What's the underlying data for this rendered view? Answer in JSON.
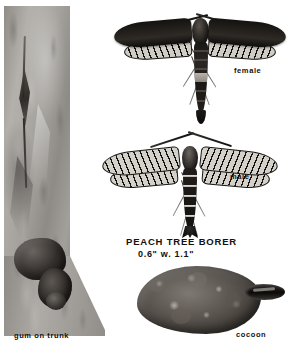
{
  "plate": {
    "subject": "PEACH TREE BORER",
    "background_color": "#ffffff",
    "ink_color": "#111111"
  },
  "title_block": {
    "common_name": "PEACH TREE BORER",
    "size_line": "0.6\" w. 1.1\"",
    "body_length": "0.6\"",
    "wingspan_prefix": "w.",
    "wingspan": "1.1\""
  },
  "figures": [
    {
      "id": "gum-on-trunk",
      "caption": "gum on trunk",
      "medium": "halftone photograph",
      "description": "grayscale bark of a peach tree trunk with a vertical crack and dark gum masses exuding near the base"
    },
    {
      "id": "female-moth",
      "caption": "female",
      "description": "clearwing moth with dark opaque forewings, veined hindwings, dark abdomen carrying a pale band"
    },
    {
      "id": "male-moth",
      "caption": "male",
      "description": "clearwing moth with transparent veined wings and a dark abdomen ringed with narrow pale bands"
    },
    {
      "id": "cocoon",
      "caption": "cocoon",
      "description": "rough lumpy soil-and-silk cocoon with a dark pupal case protruding at the right"
    }
  ],
  "captions": {
    "gum_on_trunk": "gum on trunk",
    "female": "female",
    "male": "male",
    "cocoon": "cocoon"
  }
}
